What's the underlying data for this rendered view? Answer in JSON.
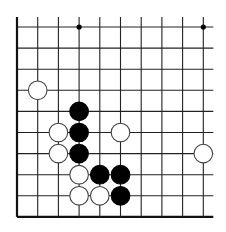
{
  "diagram": {
    "type": "go-board-fragment",
    "grid": {
      "columns": 10,
      "rows": 10,
      "x0": 17,
      "y0": 27,
      "dx": 20.7,
      "dy": 21.1,
      "line_extend_top": 10,
      "line_extend_right": 10,
      "left_edge": true,
      "bottom_edge": true,
      "line_color": "#222222",
      "edge_color": "#111111"
    },
    "star_points": [
      {
        "col": 3,
        "row": 0
      },
      {
        "col": 9,
        "row": 0
      }
    ],
    "stones": [
      {
        "color": "white",
        "col": 1,
        "row": 3
      },
      {
        "color": "black",
        "col": 3,
        "row": 4
      },
      {
        "color": "white",
        "col": 2,
        "row": 5
      },
      {
        "color": "black",
        "col": 3,
        "row": 5
      },
      {
        "color": "white",
        "col": 5,
        "row": 5
      },
      {
        "color": "white",
        "col": 2,
        "row": 6
      },
      {
        "color": "black",
        "col": 3,
        "row": 6
      },
      {
        "color": "white",
        "col": 9,
        "row": 6
      },
      {
        "color": "white",
        "col": 3,
        "row": 7
      },
      {
        "color": "black",
        "col": 4,
        "row": 7
      },
      {
        "color": "black",
        "col": 5,
        "row": 7
      },
      {
        "color": "white",
        "col": 3,
        "row": 8
      },
      {
        "color": "white",
        "col": 4,
        "row": 8
      },
      {
        "color": "black",
        "col": 5,
        "row": 8
      }
    ],
    "colors": {
      "black_stone": "#000000",
      "white_stone_fill": "#ffffff",
      "white_stone_stroke": "#444444",
      "background": "#ffffff"
    }
  }
}
